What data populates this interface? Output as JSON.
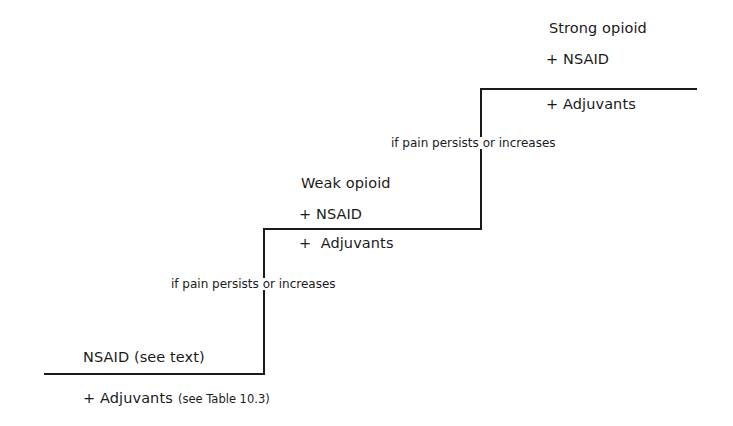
{
  "diagram": {
    "type": "staircase",
    "steps": [
      {
        "level": 1,
        "title": "NSAID (see text)",
        "adjuvants": "+ Adjuvants",
        "adjuvants_note": "(see Table 10.3)"
      },
      {
        "level": 2,
        "title": "Weak opioid",
        "nsaid": "+ NSAID",
        "adjuvants": "+  Adjuvants"
      },
      {
        "level": 3,
        "title": "Strong opioid",
        "nsaid": "+ NSAID",
        "adjuvants": "+ Adjuvants"
      }
    ],
    "transitions": [
      {
        "from": 1,
        "to": 2,
        "label": "if pain persists or increases"
      },
      {
        "from": 2,
        "to": 3,
        "label": "if pain persists or increases"
      }
    ],
    "line_color": "#1a1a1a"
  }
}
